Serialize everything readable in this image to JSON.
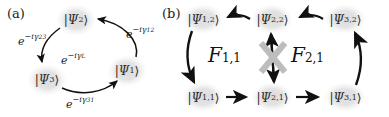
{
  "figure": {
    "width": 389,
    "height": 117,
    "background": "#ffffff",
    "node_fill": "#e3e3e3",
    "arrow_color": "#111111",
    "cross_color": "#bdbdbd",
    "text_color": "#1a1a1a"
  },
  "panels": [
    {
      "id": "panel-a",
      "label": "(a)",
      "nodes": [
        {
          "id": "psi2",
          "ket_open": "|",
          "symbol": "Ψ",
          "subscript": "2",
          "ket_close": "⟩",
          "cx": 76,
          "cy": 20
        },
        {
          "id": "psi1",
          "ket_open": "|",
          "symbol": "Ψ",
          "subscript": "1",
          "ket_close": "⟩",
          "cx": 127,
          "cy": 71
        },
        {
          "id": "psi3",
          "ket_open": "|",
          "symbol": "Ψ",
          "subscript": "3",
          "ket_close": "⟩",
          "cx": 47,
          "cy": 80
        }
      ],
      "edges": [
        {
          "id": "edge-23",
          "base": "e",
          "exponent_prefix": "−iγ",
          "exponent_sub": "23",
          "from": "psi2",
          "to": "psi3",
          "lx": 18,
          "ly": 32
        },
        {
          "id": "edge-12",
          "base": "e",
          "exponent_prefix": "−iγ",
          "exponent_sub": "12",
          "from": "psi1",
          "to": "psi2",
          "lx": 126,
          "ly": 25
        },
        {
          "id": "edge-31",
          "base": "e",
          "exponent_prefix": "−iγ",
          "exponent_sub": "31",
          "from": "psi3",
          "to": "psi1",
          "lx": 66,
          "ly": 95
        },
        {
          "id": "edge-loop",
          "base": "e",
          "exponent_prefix": "−iγ",
          "exponent_sub": "L",
          "from": "",
          "to": "",
          "lx": 61,
          "ly": 51
        }
      ]
    },
    {
      "id": "panel-b",
      "label": "(b)",
      "nodes": [
        {
          "id": "psi12",
          "ket_open": "|",
          "symbol": "Ψ",
          "subscript": "1,2",
          "ket_close": "⟩",
          "cx": 203,
          "cy": 19
        },
        {
          "id": "psi22",
          "ket_open": "|",
          "symbol": "Ψ",
          "subscript": "2,2",
          "ket_close": "⟩",
          "cx": 272,
          "cy": 19
        },
        {
          "id": "psi32",
          "ket_open": "|",
          "symbol": "Ψ",
          "subscript": "3,2",
          "ket_close": "⟩",
          "cx": 345,
          "cy": 19
        },
        {
          "id": "psi11",
          "ket_open": "|",
          "symbol": "Ψ",
          "subscript": "1,1",
          "ket_close": "⟩",
          "cx": 203,
          "cy": 97
        },
        {
          "id": "psi21",
          "ket_open": "|",
          "symbol": "Ψ",
          "subscript": "2,1",
          "ket_close": "⟩",
          "cx": 272,
          "cy": 97
        },
        {
          "id": "psi31",
          "ket_open": "|",
          "symbol": "Ψ",
          "subscript": "3,1",
          "ket_close": "⟩",
          "cx": 345,
          "cy": 97
        }
      ],
      "cycle_labels": [
        {
          "id": "F11",
          "letter": "F",
          "subscript": "1,1",
          "lx": 222,
          "ly": 47
        },
        {
          "id": "F21",
          "letter": "F",
          "subscript": "2,1",
          "lx": 297,
          "ly": 47
        }
      ],
      "blocked_transition": {
        "id": "blocked-vertical-transition",
        "marker": "×",
        "between": [
          "psi21",
          "psi22"
        ]
      }
    }
  ]
}
